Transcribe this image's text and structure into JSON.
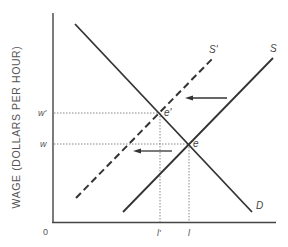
{
  "diagram": {
    "type": "supply-demand-labor-market",
    "axes": {
      "y_label": "WAGE (DOLLARS PER HOUR)",
      "origin_label": "0",
      "y_ticks": [
        "w'",
        "w"
      ],
      "x_ticks": [
        "l'",
        "l"
      ]
    },
    "curves": {
      "demand": "D",
      "supply": "S",
      "supply_shifted": "S'"
    },
    "points": {
      "initial_equilibrium": "e",
      "new_equilibrium": "e'"
    },
    "arrows": [
      {
        "direction": "left",
        "meaning": "supply shift"
      },
      {
        "direction": "left",
        "meaning": "employment change"
      }
    ],
    "colors": {
      "line": "#333333",
      "guide": "#888888",
      "text": "#555555"
    }
  }
}
